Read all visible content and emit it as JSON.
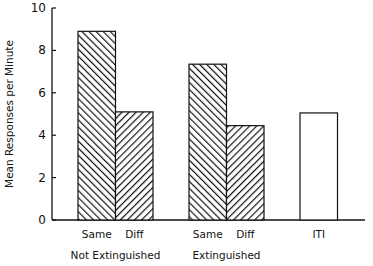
{
  "chart_data": {
    "type": "bar",
    "title": "",
    "xlabel": "",
    "ylabel": "Mean Responses per Minute",
    "ylim": [
      0,
      10
    ],
    "yticks": [
      0,
      2,
      4,
      6,
      8,
      10
    ],
    "grid": false,
    "legend": null,
    "groups": [
      {
        "label": "Not Extinguished",
        "bars": [
          {
            "label": "Same",
            "value": 8.9,
            "fill": "hatch-backslash"
          },
          {
            "label": "Diff",
            "value": 5.1,
            "fill": "hatch-slash"
          }
        ]
      },
      {
        "label": "Extinguished",
        "bars": [
          {
            "label": "Same",
            "value": 7.35,
            "fill": "hatch-backslash"
          },
          {
            "label": "Diff",
            "value": 4.45,
            "fill": "hatch-slash"
          }
        ]
      },
      {
        "label": "",
        "bars": [
          {
            "label": "ITI",
            "value": 5.05,
            "fill": "white"
          }
        ]
      }
    ],
    "categories": [
      "Same",
      "Diff",
      "Same",
      "Diff",
      "ITI"
    ],
    "values": [
      8.9,
      5.1,
      7.35,
      4.45,
      5.05
    ],
    "colors": {
      "stroke": "#111111",
      "background": "#ffffff"
    }
  }
}
